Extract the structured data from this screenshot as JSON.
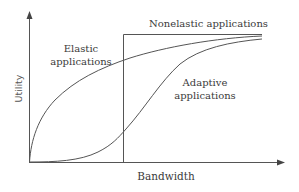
{
  "diagram": {
    "type": "utility-vs-bandwidth",
    "axes": {
      "x_label": "Bandwidth",
      "y_label": "Utility"
    },
    "curves": [
      {
        "id": "nonelastic",
        "label": "Nonelastic applications",
        "shape": "step"
      },
      {
        "id": "elastic",
        "label_line1": "Elastic",
        "label_line2": "applications",
        "shape": "concave"
      },
      {
        "id": "adaptive",
        "label_line1": "Adaptive",
        "label_line2": "applications",
        "shape": "sigmoid"
      }
    ],
    "colors": {
      "line": "#555555",
      "text": "#3a3a3a",
      "background": "#ffffff"
    }
  }
}
